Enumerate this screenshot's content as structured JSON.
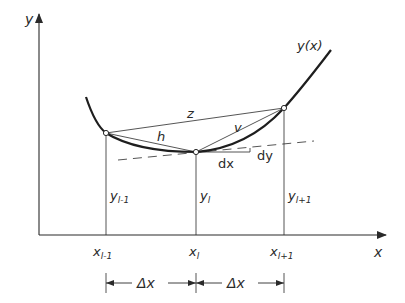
{
  "axes": {
    "x_label": "x",
    "y_label": "y"
  },
  "curve": {
    "label": "y(x)"
  },
  "chords": {
    "z": "z",
    "h": "h",
    "v": "v"
  },
  "tangent": {
    "dx": "dx",
    "dy": "dy"
  },
  "ordinates": {
    "prev": "y",
    "prev_sub": "l-1",
    "cur": "y",
    "cur_sub": "l",
    "next": "y",
    "next_sub": "l+1"
  },
  "abscissae": {
    "prev": "x",
    "prev_sub": "l-1",
    "cur": "x",
    "cur_sub": "l",
    "next": "x",
    "next_sub": "l+1"
  },
  "spacing": {
    "left": "Δx",
    "right": "Δx"
  },
  "colors": {
    "ink": "#2a2a2a",
    "background": "#ffffff"
  }
}
